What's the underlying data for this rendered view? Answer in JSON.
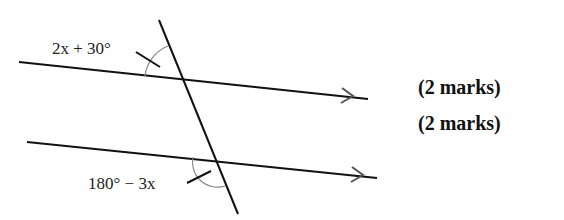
{
  "diagram": {
    "type": "parallel-lines-transversal",
    "angles": [
      {
        "label": "2x + 30°",
        "position": "upper-left of top intersection"
      },
      {
        "label": "180° − 3x",
        "position": "lower-left of bottom intersection"
      }
    ],
    "parallel_marks": "single arrow on each line"
  },
  "labels": {
    "angle_top": "2x + 30°",
    "angle_bottom": "180° − 3x"
  },
  "marks": [
    "(2 marks)",
    "(2 marks)"
  ]
}
